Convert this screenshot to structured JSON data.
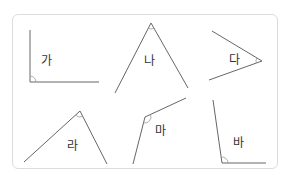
{
  "angles": [
    {
      "id": "ga",
      "label": "가",
      "vertex": [
        30,
        82
      ],
      "ends": [
        [
          30,
          30
        ],
        [
          99,
          82
        ]
      ],
      "label_pos": [
        41,
        55
      ]
    },
    {
      "id": "na",
      "label": "나",
      "vertex": [
        151,
        23
      ],
      "ends": [
        [
          115,
          93
        ],
        [
          188,
          88
        ]
      ],
      "label_pos": [
        144,
        55
      ]
    },
    {
      "id": "da",
      "label": "다",
      "vertex": [
        262,
        61
      ],
      "ends": [
        [
          212,
          31
        ],
        [
          209,
          80
        ]
      ],
      "label_pos": [
        229,
        54
      ]
    },
    {
      "id": "ra",
      "label": "라",
      "vertex": [
        80,
        111
      ],
      "ends": [
        [
          24,
          162
        ],
        [
          107,
          164
        ]
      ],
      "label_pos": [
        67,
        140
      ]
    },
    {
      "id": "ma",
      "label": "마",
      "vertex": [
        145,
        117
      ],
      "ends": [
        [
          186,
          98
        ],
        [
          133,
          164
        ]
      ],
      "label_pos": [
        155,
        125
      ]
    },
    {
      "id": "ba",
      "label": "바",
      "vertex": [
        222,
        163
      ],
      "ends": [
        [
          213,
          100
        ],
        [
          266,
          163
        ]
      ],
      "label_pos": [
        233,
        137
      ]
    }
  ],
  "colors": {
    "line": "#666666",
    "border": "#dcdcdc",
    "arc": "#999999"
  }
}
